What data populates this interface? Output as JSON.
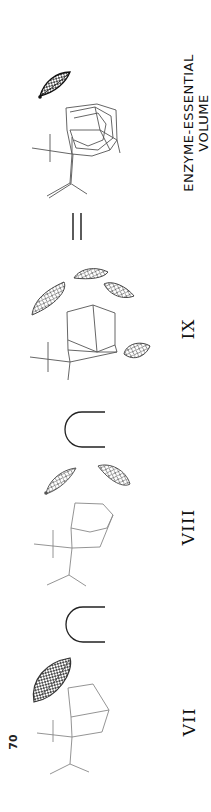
{
  "page": {
    "page_number": "70",
    "orientation": "rotated-90-ccw"
  },
  "figure": {
    "equation_symbols": {
      "subset_1": "⊂",
      "subset_2": "⊂",
      "equals": "="
    },
    "panels": [
      {
        "id": "VII",
        "label": "VII",
        "description": "bicyclic wireframe molecule with one large dense grid volume"
      },
      {
        "id": "VIII",
        "label": "VIII",
        "description": "bicyclic wireframe molecule with two grid volumes"
      },
      {
        "id": "IX",
        "label": "IX",
        "description": "adamantane-like wireframe molecule with four grid volumes"
      },
      {
        "id": "result",
        "label_line1": "ENZYME-ESSENTIAL",
        "label_line2": "VOLUME",
        "description": "superimposed wireframe molecules with single grid volume"
      }
    ]
  },
  "colors": {
    "line": "#555555",
    "mesh_dark": "#2a2a2a",
    "mesh_mid": "#666666",
    "text": "#111111"
  }
}
